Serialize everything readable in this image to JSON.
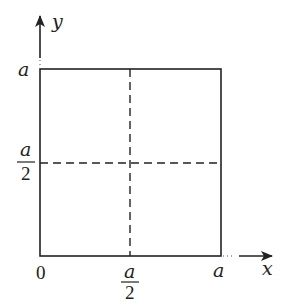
{
  "figure": {
    "type": "coordinate-square-diagram",
    "axes": {
      "x_label": "x",
      "y_label": "y",
      "origin_label": "0"
    },
    "ticks": {
      "x_mid": {
        "num": "a",
        "den": "2"
      },
      "x_end": "a",
      "y_mid": {
        "num": "a",
        "den": "2"
      },
      "y_end": "a"
    },
    "colors": {
      "stroke": "#222222",
      "background": "#ffffff"
    }
  }
}
